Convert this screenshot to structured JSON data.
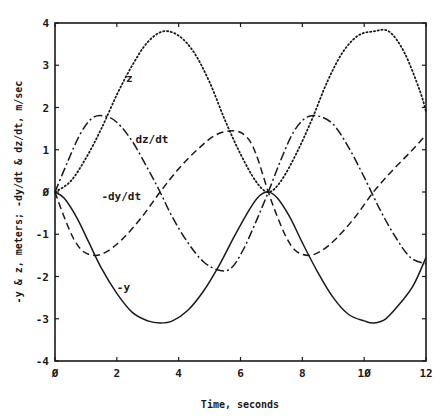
{
  "chart_data": {
    "type": "line",
    "title": "",
    "xlabel": "Time, seconds",
    "ylabel": "-y & z, meters; -dy/dt & dz/dt, m/sec",
    "xlim": [
      0,
      12
    ],
    "ylim": [
      -4,
      4
    ],
    "x_ticks": [
      0,
      2,
      4,
      6,
      8,
      10,
      12
    ],
    "x_tick_labels": [
      "Ø",
      "2",
      "4",
      "6",
      "8",
      "1Ø",
      "12"
    ],
    "y_ticks": [
      -4,
      -3,
      -2,
      -1,
      0,
      1,
      2,
      3,
      4
    ],
    "y_tick_labels": [
      "-4",
      "-3",
      "-2",
      "-1",
      "Ø",
      "1",
      "2",
      "3",
      "4"
    ],
    "grid": false,
    "legend": "inline curve labels",
    "series": [
      {
        "name": "z",
        "style": "dotted",
        "label_pos": [
          2.3,
          2.6
        ],
        "x": [
          0,
          0.5,
          1,
          1.5,
          2,
          2.5,
          3,
          3.5,
          4,
          4.5,
          5,
          5.5,
          6,
          6.5,
          6.9,
          7.3,
          7.8,
          8.3,
          8.8,
          9.3,
          9.8,
          10.3,
          10.8,
          11.3,
          11.8,
          12
        ],
        "y": [
          0,
          0.25,
          0.8,
          1.5,
          2.3,
          3.0,
          3.55,
          3.8,
          3.7,
          3.3,
          2.6,
          1.7,
          0.9,
          0.25,
          0,
          0.25,
          0.9,
          1.7,
          2.6,
          3.3,
          3.7,
          3.8,
          3.8,
          3.3,
          2.4,
          1.9
        ]
      },
      {
        "name": "dz/dt",
        "style": "dash-dot",
        "label_pos": [
          2.6,
          1.15
        ],
        "x": [
          0,
          0.4,
          0.8,
          1.2,
          1.6,
          2,
          2.5,
          3,
          3.4,
          3.8,
          4.3,
          4.8,
          5.3,
          5.7,
          6.1,
          6.5,
          6.9,
          7.3,
          7.7,
          8.1,
          8.5,
          9,
          9.5,
          10,
          10.5,
          11,
          11.5,
          12
        ],
        "y": [
          0,
          0.7,
          1.35,
          1.75,
          1.8,
          1.65,
          1.2,
          0.55,
          0,
          -0.6,
          -1.2,
          -1.65,
          -1.85,
          -1.8,
          -1.35,
          -0.7,
          0,
          0.75,
          1.4,
          1.75,
          1.8,
          1.6,
          1.05,
          0.35,
          -0.4,
          -1.05,
          -1.55,
          -1.7
        ]
      },
      {
        "name": "-dy/dt",
        "style": "dashed",
        "label_pos": [
          1.5,
          -0.2
        ],
        "x": [
          0,
          0.3,
          0.6,
          0.9,
          1.3,
          1.7,
          2.2,
          2.8,
          3.4,
          4,
          4.6,
          5.2,
          5.8,
          6.2,
          6.5,
          6.9,
          7.2,
          7.5,
          7.8,
          8.2,
          8.6,
          9.1,
          9.7,
          10.3,
          10.9,
          11.5,
          12
        ],
        "y": [
          0,
          -0.6,
          -1.1,
          -1.4,
          -1.5,
          -1.4,
          -1.1,
          -0.6,
          0,
          0.55,
          1.0,
          1.35,
          1.45,
          1.3,
          0.9,
          0,
          -0.6,
          -1.1,
          -1.4,
          -1.5,
          -1.4,
          -1.1,
          -0.6,
          0,
          0.5,
          0.95,
          1.35
        ]
      },
      {
        "name": "-y",
        "style": "solid",
        "label_pos": [
          2.0,
          -2.35
        ],
        "x": [
          0,
          0.3,
          0.7,
          1.1,
          1.5,
          2,
          2.5,
          3,
          3.4,
          3.8,
          4.3,
          4.8,
          5.3,
          5.8,
          6.3,
          6.6,
          6.9,
          7.2,
          7.6,
          8,
          8.5,
          9,
          9.5,
          10,
          10.3,
          10.7,
          11.2,
          11.6,
          12
        ],
        "y": [
          0,
          -0.15,
          -0.6,
          -1.2,
          -1.8,
          -2.4,
          -2.85,
          -3.05,
          -3.1,
          -3.05,
          -2.8,
          -2.35,
          -1.75,
          -1.05,
          -0.4,
          -0.1,
          0,
          -0.15,
          -0.6,
          -1.2,
          -1.9,
          -2.5,
          -2.9,
          -3.05,
          -3.1,
          -3.0,
          -2.6,
          -2.2,
          -1.55
        ]
      }
    ]
  },
  "axes": {
    "xlabel": "Time, seconds",
    "ylabel": "-y & z, meters; -dy/dt & dz/dt, m/sec"
  },
  "colors": {
    "ink": "#1a1a1a",
    "background": "#ffffff"
  }
}
